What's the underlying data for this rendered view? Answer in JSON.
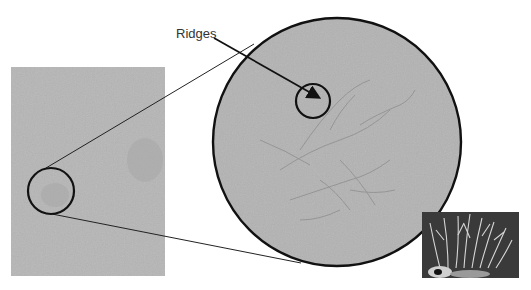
{
  "diagram": {
    "label_ridges": "Ridges",
    "colors": {
      "background": "#ffffff",
      "photo_gray": "#b4b4b4",
      "magnified_gray": "#b2b2b2",
      "outline": "#111111",
      "inset_dark": "#3a3a3a",
      "inset_light": "#d8d8d8"
    },
    "left_photo": {
      "x": 11,
      "y": 67,
      "w": 154,
      "h": 209
    },
    "small_circle": {
      "cx": 51,
      "cy": 191,
      "r": 23
    },
    "magnified_circle": {
      "cx": 337,
      "cy": 142,
      "r": 124
    },
    "ridge_circle": {
      "cx": 313,
      "cy": 101,
      "r": 17
    },
    "inset_photo": {
      "x": 422,
      "y": 212,
      "w": 97,
      "h": 66,
      "subject": "branching coral-like ridges"
    }
  }
}
